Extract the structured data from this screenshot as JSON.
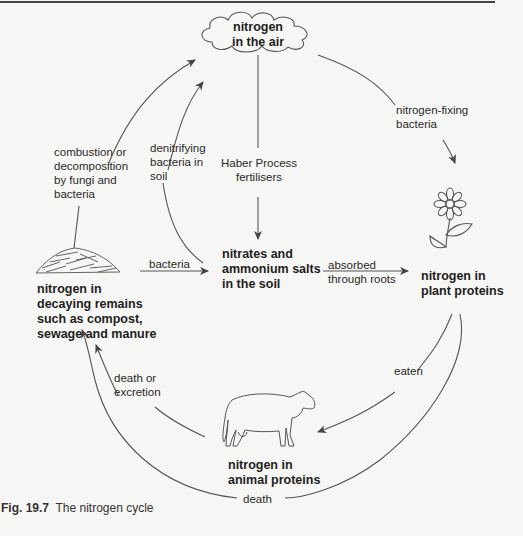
{
  "diagram": {
    "title": "The nitrogen cycle",
    "nodes": {
      "air": "nitrogen in the air",
      "air_line1": "nitrogen",
      "air_line2": "in the air",
      "soil_line1": "nitrates and",
      "soil_line2": "ammonium salts",
      "soil_line3": "in the soil",
      "plant_line1": "nitrogen in",
      "plant_line2": "plant proteins",
      "animal_line1": "nitrogen in",
      "animal_line2": "animal proteins",
      "decay_line1": "nitrogen in",
      "decay_line2": "decaying remains",
      "decay_line3": "such as compost,",
      "decay_line4": "sewage and manure"
    },
    "edges": {
      "combustion": [
        "combustion or",
        "decomposition",
        "by fungi and",
        "bacteria"
      ],
      "denitrifying": [
        "denitrifying",
        "bacteria in",
        "soil"
      ],
      "haber": [
        "Haber Process",
        "fertilisers"
      ],
      "fixing": [
        "nitrogen-fixing",
        "bacteria"
      ],
      "bacteria": "bacteria",
      "absorbed": [
        "absorbed",
        "through roots"
      ],
      "eaten": "eaten",
      "death_excretion": [
        "death or",
        "excretion"
      ],
      "death": "death"
    },
    "icons": [
      "cloud-icon",
      "flower-icon",
      "cow-icon",
      "compost-heap-icon"
    ]
  },
  "caption": {
    "figure_number": "Fig. 19.7",
    "text": "The nitrogen cycle"
  }
}
